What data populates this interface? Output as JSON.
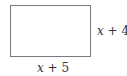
{
  "diagram": {
    "shape": "rectangle",
    "side_label": {
      "variable": "x",
      "rest": " + 4"
    },
    "bottom_label": {
      "variable": "x",
      "rest": " + 5"
    },
    "colors": {
      "stroke": "#7a7a7a",
      "text": "#333333",
      "background": "#ffffff"
    }
  }
}
